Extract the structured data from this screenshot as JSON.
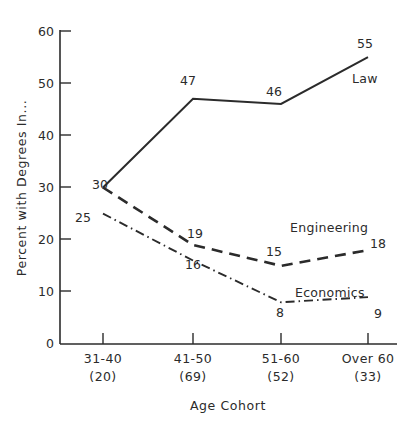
{
  "chart_data": {
    "type": "line",
    "title": "",
    "xlabel": "Age Cohort",
    "ylabel": "Percent with Degrees In...",
    "categories": [
      "31-40",
      "41-50",
      "51-60",
      "Over 60"
    ],
    "category_sublabels": [
      "(20)",
      "(69)",
      "(52)",
      "(33)"
    ],
    "ylim": [
      0,
      60
    ],
    "yticks": [
      0,
      10,
      20,
      30,
      40,
      50,
      60
    ],
    "ytick_labels": [
      "0",
      "10",
      "20",
      "30",
      "40",
      "50",
      "60"
    ],
    "grid": false,
    "legend_position": "inline-right",
    "series": [
      {
        "name": "Law",
        "style": "solid",
        "values": [
          30,
          47,
          46,
          55
        ],
        "value_labels": [
          "30",
          "47",
          "46",
          "55"
        ]
      },
      {
        "name": "Engineering",
        "style": "dashed",
        "values": [
          30,
          19,
          15,
          18
        ],
        "value_labels": [
          "30",
          "19",
          "15",
          "18"
        ]
      },
      {
        "name": "Economics",
        "style": "dash-dot",
        "values": [
          25,
          16,
          8,
          9
        ],
        "value_labels": [
          "25",
          "16",
          "8",
          "9"
        ]
      }
    ],
    "colors": {
      "ink": "#2b2b2b",
      "background": "#ffffff"
    }
  },
  "labels": {
    "y_axis_title": "Percent with Degrees In...",
    "x_axis_title": "Age Cohort",
    "ytick_60": "60",
    "ytick_50": "50",
    "ytick_40": "40",
    "ytick_30": "30",
    "ytick_20": "20",
    "ytick_10": "10",
    "ytick_0": "0",
    "xtick_0": "31-40",
    "xtick_1": "41-50",
    "xtick_2": "51-60",
    "xtick_3": "Over 60",
    "xsub_0": "(20)",
    "xsub_1": "(69)",
    "xsub_2": "(52)",
    "xsub_3": "(33)",
    "law_name": "Law",
    "eng_name": "Engineering",
    "eco_name": "Economics",
    "law_v0": "30",
    "law_v1": "47",
    "law_v2": "46",
    "law_v3": "55",
    "eng_v1": "19",
    "eng_v2": "15",
    "eng_v3": "18",
    "eco_v0": "25",
    "eco_v1": "16",
    "eco_v2": "8",
    "eco_v3": "9"
  }
}
